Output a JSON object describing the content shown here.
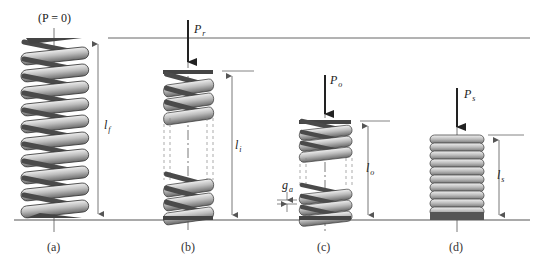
{
  "figure": {
    "zero_load_label": "(P = 0)",
    "panels": [
      {
        "id": "a",
        "caption": "(a)",
        "length_label": {
          "main": "l",
          "sub": "f"
        },
        "load_label": null,
        "coils": 10
      },
      {
        "id": "b",
        "caption": "(b)",
        "length_label": {
          "main": "l",
          "sub": "i"
        },
        "load_label": {
          "main": "P",
          "sub": "r"
        },
        "coils": "3 top + 3 bottom (broken view)"
      },
      {
        "id": "c",
        "caption": "(c)",
        "length_label": {
          "main": "l",
          "sub": "o"
        },
        "load_label": {
          "main": "P",
          "sub": "o"
        },
        "gap_label": {
          "main": "g",
          "sub": "a"
        },
        "coils": "3 top + 3 bottom (broken view)"
      },
      {
        "id": "d",
        "caption": "(d)",
        "length_label": {
          "main": "l",
          "sub": "s"
        },
        "load_label": {
          "main": "P",
          "sub": "s"
        },
        "coils": 10
      }
    ],
    "colors": {
      "coil_fill": "#a9a9a9",
      "coil_highlight": "#e6e6e6",
      "coil_stroke": "#3a3a3a",
      "line": "#555555",
      "arrow": "#222222"
    }
  }
}
